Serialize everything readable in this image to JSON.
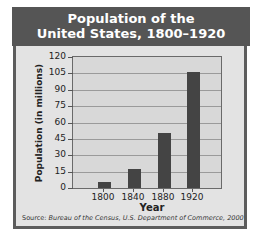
{
  "chart_data": {
    "type": "bar",
    "title": "Population of the United States, 1800–1920",
    "title_lines": [
      "Population of the",
      "United States, 1800–1920"
    ],
    "categories": [
      "1800",
      "1840",
      "1880",
      "1920"
    ],
    "values": [
      5.3,
      17,
      50,
      106
    ],
    "xlabel": "Year",
    "ylabel": "Population (in millions)",
    "ylim": [
      0,
      120
    ],
    "yticks": [
      "120",
      "105",
      "90",
      "75",
      "60",
      "45",
      "30",
      "15",
      "0"
    ],
    "grid": true,
    "legend": null,
    "bar_color": "#444444",
    "source_prefix": "Source:",
    "source": "Bureau of the Census, U.S. Department of Commerce, 2000"
  }
}
